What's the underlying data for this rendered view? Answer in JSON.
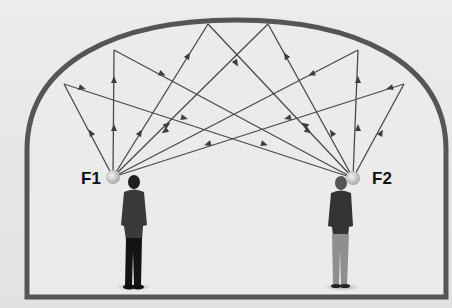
{
  "diagram": {
    "foci": [
      {
        "id": "F1",
        "label": "F1",
        "x": 113,
        "y": 177
      },
      {
        "id": "F2",
        "label": "F2",
        "x": 353,
        "y": 178
      }
    ],
    "ceiling_reflection_points": [
      {
        "x": 64,
        "y": 84
      },
      {
        "x": 114,
        "y": 50
      },
      {
        "x": 208,
        "y": 24
      },
      {
        "x": 268,
        "y": 24
      },
      {
        "x": 358,
        "y": 50
      },
      {
        "x": 404,
        "y": 84
      }
    ],
    "colors": {
      "wall": "#555555",
      "ray": "#4a4a4a",
      "background": "#e6e6e6",
      "room_fill": "#ebebeb"
    },
    "people": [
      {
        "name": "person-left",
        "position": "under F1"
      },
      {
        "name": "person-right",
        "position": "under F2"
      }
    ]
  }
}
